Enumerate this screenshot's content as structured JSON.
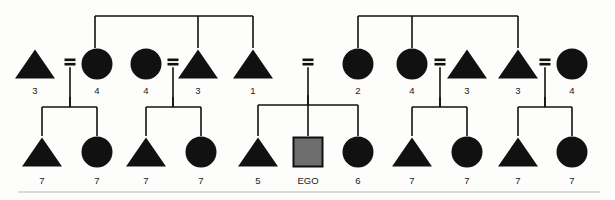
{
  "diagram": {
    "type": "kinship-pedigree-chart",
    "title": "",
    "ego_label": "EGO",
    "canvas": {
      "width": 615,
      "height": 200
    },
    "colors": {
      "background": "#fdfdfb",
      "node_fill": "#111111",
      "ego_fill": "#6e6e6e",
      "line": "#111111",
      "label_text": "#1a1a1a",
      "page_rule": "#cfcfc9"
    },
    "symbol_legend": {
      "triangle": "male",
      "circle": "female",
      "square_gray": "ego",
      "equals": "marriage-union",
      "vertical_line": "descent-line",
      "horizontal_line": "sibling-bar"
    },
    "generations": [
      {
        "name": "generation-1",
        "y": 64,
        "nodes": [
          {
            "id": "g1-n1",
            "shape": "triangle",
            "sex": "male",
            "x": 35,
            "label": "3"
          },
          {
            "id": "g1-n2",
            "shape": "circle",
            "sex": "female",
            "x": 97,
            "label": "4"
          },
          {
            "id": "g1-n3",
            "shape": "circle",
            "sex": "female",
            "x": 146,
            "label": "4"
          },
          {
            "id": "g1-n4",
            "shape": "triangle",
            "sex": "male",
            "x": 198,
            "label": "3"
          },
          {
            "id": "g1-n5",
            "shape": "triangle",
            "sex": "male",
            "x": 253,
            "label": "1"
          },
          {
            "id": "g1-n6",
            "shape": "circle",
            "sex": "female",
            "x": 358,
            "label": "2"
          },
          {
            "id": "g1-n7",
            "shape": "circle",
            "sex": "female",
            "x": 412,
            "label": "4"
          },
          {
            "id": "g1-n8",
            "shape": "triangle",
            "sex": "male",
            "x": 467,
            "label": "3"
          },
          {
            "id": "g1-n9",
            "shape": "triangle",
            "sex": "male",
            "x": 518,
            "label": "3"
          },
          {
            "id": "g1-n10",
            "shape": "circle",
            "sex": "female",
            "x": 572,
            "label": "4"
          }
        ],
        "label_y": 91
      },
      {
        "name": "generation-2",
        "y": 152,
        "nodes": [
          {
            "id": "g2-n1",
            "shape": "triangle",
            "sex": "male",
            "x": 42,
            "label": "7"
          },
          {
            "id": "g2-n2",
            "shape": "circle",
            "sex": "female",
            "x": 97,
            "label": "7"
          },
          {
            "id": "g2-n3",
            "shape": "triangle",
            "sex": "male",
            "x": 146,
            "label": "7"
          },
          {
            "id": "g2-n4",
            "shape": "circle",
            "sex": "female",
            "x": 201,
            "label": "7"
          },
          {
            "id": "g2-n5",
            "shape": "triangle",
            "sex": "male",
            "x": 258,
            "label": "5"
          },
          {
            "id": "g2-ego",
            "shape": "square",
            "sex": "ego",
            "x": 308,
            "label": "EGO"
          },
          {
            "id": "g2-n7",
            "shape": "circle",
            "sex": "female",
            "x": 358,
            "label": "6"
          },
          {
            "id": "g2-n8",
            "shape": "triangle",
            "sex": "male",
            "x": 412,
            "label": "7"
          },
          {
            "id": "g2-n9",
            "shape": "circle",
            "sex": "female",
            "x": 467,
            "label": "7"
          },
          {
            "id": "g2-n10",
            "shape": "triangle",
            "sex": "male",
            "x": 518,
            "label": "7"
          },
          {
            "id": "g2-n11",
            "shape": "circle",
            "sex": "female",
            "x": 572,
            "label": "7"
          }
        ],
        "label_y": 181
      }
    ],
    "marriages": [
      {
        "id": "m1",
        "x": 70,
        "y": 62,
        "left": "g1-n1",
        "right": "g1-n2",
        "descent_to": 107
      },
      {
        "id": "m2",
        "x": 173,
        "y": 62,
        "left": "g1-n3",
        "right": "g1-n4",
        "descent_to": 107
      },
      {
        "id": "m3",
        "x": 308,
        "y": 62,
        "left": "g1-n5",
        "right": "g1-n6",
        "descent_to": 105
      },
      {
        "id": "m4",
        "x": 440,
        "y": 62,
        "left": "g1-n7",
        "right": "g1-n8",
        "descent_to": 107
      },
      {
        "id": "m5",
        "x": 545,
        "y": 62,
        "left": "g1-n9",
        "right": "g1-n10",
        "descent_to": 107
      }
    ],
    "sibling_groups": [
      {
        "id": "sib-top-left",
        "bar_y": 16,
        "bar_x1": 95,
        "bar_x2": 253,
        "parent_drop_x": null,
        "child_drops": [
          95,
          198,
          253
        ],
        "child_drop_to": 48
      },
      {
        "id": "sib-top-right",
        "bar_y": 16,
        "bar_x1": 358,
        "bar_x2": 518,
        "parent_drop_x": null,
        "child_drops": [
          358,
          412,
          518
        ],
        "child_drop_to": 48
      },
      {
        "id": "sib-bottom-1",
        "bar_y": 107,
        "bar_x1": 42,
        "bar_x2": 97,
        "parent_drop_x": 70,
        "child_drops": [
          42,
          97
        ],
        "child_drop_to": 136
      },
      {
        "id": "sib-bottom-2",
        "bar_y": 107,
        "bar_x1": 146,
        "bar_x2": 201,
        "parent_drop_x": 173,
        "child_drops": [
          146,
          201
        ],
        "child_drop_to": 136
      },
      {
        "id": "sib-bottom-ego",
        "bar_y": 105,
        "bar_x1": 258,
        "bar_x2": 358,
        "parent_drop_x": 308,
        "child_drops": [
          258,
          308,
          358
        ],
        "child_drop_to": 136
      },
      {
        "id": "sib-bottom-4",
        "bar_y": 107,
        "bar_x1": 412,
        "bar_x2": 467,
        "parent_drop_x": 440,
        "child_drops": [
          412,
          467
        ],
        "child_drop_to": 136
      },
      {
        "id": "sib-bottom-5",
        "bar_y": 107,
        "bar_x1": 518,
        "bar_x2": 572,
        "parent_drop_x": 545,
        "child_drops": [
          518,
          572
        ],
        "child_drop_to": 136
      }
    ],
    "page_rule": {
      "x1": 18,
      "x2": 600,
      "y": 192
    }
  }
}
